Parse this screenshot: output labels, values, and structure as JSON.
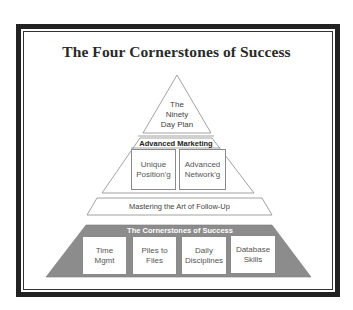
{
  "title": "The Four Cornerstones of Success",
  "colors": {
    "frame": "#222222",
    "base_tier_fill": "#8c8c8c",
    "outline": "#8a8a8a",
    "text": "#444444"
  },
  "pyramid": {
    "apex": {
      "line1": "The",
      "line2": "Ninety",
      "line3": "Day Plan"
    },
    "advanced_marketing": {
      "header": "Advanced Marketing",
      "boxes": [
        {
          "line1": "Unique",
          "line2": "Position'g"
        },
        {
          "line1": "Advanced",
          "line2": "Network'g"
        }
      ]
    },
    "follow_up": {
      "label": "Mastering the Art of Follow-Up"
    },
    "base": {
      "header": "The Cornerstones of Success",
      "boxes": [
        {
          "line1": "Time",
          "line2": "Mgmt"
        },
        {
          "line1": "Piles to",
          "line2": "Files"
        },
        {
          "line1": "Daily",
          "line2": "Disciplines"
        },
        {
          "line1": "Database",
          "line2": "Skills"
        }
      ]
    }
  }
}
